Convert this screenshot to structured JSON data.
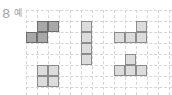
{
  "label": {
    "number": "8",
    "text": "예"
  },
  "grid": {
    "cell_size": 11,
    "cols": 13,
    "rows": 8,
    "origin_x": 26,
    "origin_y": 10,
    "line_color": "#d6d6d6"
  },
  "colors": {
    "dark_fill": "#a8a8a8",
    "light_fill": "#dcdcdc",
    "border": "#8a8a8a"
  },
  "shapes": [
    {
      "name": "z-tetromino-example",
      "style": "dark",
      "cells": [
        [
          1,
          1
        ],
        [
          2,
          1
        ],
        [
          0,
          2
        ],
        [
          1,
          2
        ]
      ]
    },
    {
      "name": "i-tetromino",
      "style": "light",
      "cells": [
        [
          5,
          1
        ],
        [
          5,
          2
        ],
        [
          5,
          3
        ],
        [
          5,
          4
        ]
      ]
    },
    {
      "name": "l-tetromino",
      "style": "light",
      "cells": [
        [
          10,
          1
        ],
        [
          8,
          2
        ],
        [
          9,
          2
        ],
        [
          10,
          2
        ]
      ]
    },
    {
      "name": "t-tetromino",
      "style": "light",
      "cells": [
        [
          9,
          4
        ],
        [
          8,
          5
        ],
        [
          9,
          5
        ],
        [
          10,
          5
        ]
      ]
    },
    {
      "name": "o-tetromino",
      "style": "light",
      "cells": [
        [
          1,
          5
        ],
        [
          2,
          5
        ],
        [
          1,
          6
        ],
        [
          2,
          6
        ]
      ]
    }
  ]
}
